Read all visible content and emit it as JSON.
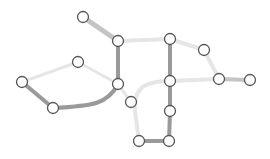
{
  "diagram": {
    "type": "network-graph",
    "colors": {
      "background": "#ffffff",
      "node_fill": "#ffffff",
      "node_stroke": "#555555",
      "edge_dark": "#9a9a9a",
      "edge_medium": "#c4c4c4",
      "edge_light": "#e6e6e6"
    },
    "nodes": [
      {
        "id": "n1",
        "x": 83,
        "y": 17
      },
      {
        "id": "n2",
        "x": 118,
        "y": 41
      },
      {
        "id": "n3",
        "x": 170,
        "y": 39
      },
      {
        "id": "n4",
        "x": 204,
        "y": 50
      },
      {
        "id": "n5",
        "x": 219,
        "y": 79
      },
      {
        "id": "n6",
        "x": 250,
        "y": 80
      },
      {
        "id": "n7",
        "x": 170,
        "y": 81
      },
      {
        "id": "n8",
        "x": 170,
        "y": 111
      },
      {
        "id": "n9",
        "x": 169,
        "y": 141
      },
      {
        "id": "n10",
        "x": 139,
        "y": 141
      },
      {
        "id": "n11",
        "x": 131,
        "y": 102
      },
      {
        "id": "n12",
        "x": 118,
        "y": 84
      },
      {
        "id": "n13",
        "x": 78,
        "y": 62
      },
      {
        "id": "n14",
        "x": 22,
        "y": 82
      },
      {
        "id": "n15",
        "x": 53,
        "y": 108
      }
    ],
    "edges": [
      {
        "from": "n1",
        "to": "n2",
        "weight": "medium",
        "width": 5
      },
      {
        "from": "n2",
        "to": "n3",
        "weight": "light",
        "width": 4
      },
      {
        "from": "n2",
        "to": "n12",
        "weight": "dark",
        "width": 4
      },
      {
        "from": "n3",
        "to": "n7",
        "weight": "dark",
        "width": 4
      },
      {
        "from": "n3",
        "to": "n4",
        "weight": "light",
        "width": 4
      },
      {
        "from": "n4",
        "to": "n5",
        "weight": "light",
        "width": 4
      },
      {
        "from": "n5",
        "to": "n6",
        "weight": "medium",
        "width": 4
      },
      {
        "from": "n7",
        "to": "n5",
        "weight": "light",
        "width": 4
      },
      {
        "from": "n7",
        "to": "n8",
        "weight": "dark",
        "width": 4
      },
      {
        "from": "n8",
        "to": "n9",
        "weight": "dark",
        "width": 4
      },
      {
        "from": "n9",
        "to": "n10",
        "weight": "dark",
        "width": 4
      },
      {
        "from": "n10",
        "to": "n7",
        "weight": "light",
        "width": 4,
        "curved": true
      },
      {
        "from": "n12",
        "to": "n11",
        "weight": "light",
        "width": 3
      },
      {
        "from": "n13",
        "to": "n12",
        "weight": "light",
        "width": 3
      },
      {
        "from": "n13",
        "to": "n14",
        "weight": "light",
        "width": 3
      },
      {
        "from": "n14",
        "to": "n15",
        "weight": "dark",
        "width": 4
      },
      {
        "from": "n15",
        "to": "n12",
        "weight": "dark",
        "width": 4,
        "curved": true
      }
    ]
  }
}
